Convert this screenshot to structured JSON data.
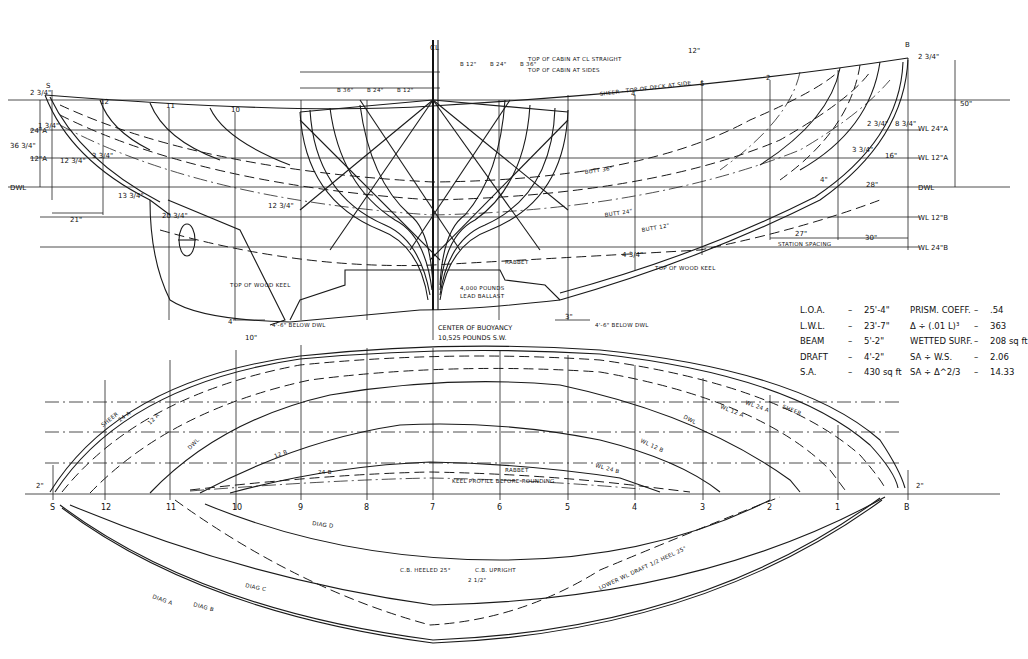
{
  "drawing": {
    "type": "yacht lines plan",
    "views": [
      "profile",
      "body-plan",
      "half-breadth"
    ],
    "colors": {
      "ink": "#1a1a1a",
      "paper": "#ffffff"
    }
  },
  "profile": {
    "stations": [
      "S",
      "12",
      "11",
      "10",
      "9",
      "8",
      "7",
      "6",
      "5",
      "4",
      "3",
      "2",
      "1",
      "B"
    ],
    "waterlines_right": [
      "WL 24\"A",
      "WL 12\"A",
      "DWL",
      "WL 12\"B",
      "WL 24\"B"
    ],
    "waterlines_left": [
      "24\"A",
      "12\"A",
      "DWL"
    ],
    "dims": {
      "stern_height": "36 3/4\"",
      "bow_height": "50\"",
      "stern_overhang": "21\"",
      "station_spacing_value": "27\"",
      "station_spacing_label": "STATION SPACING",
      "bow_overhang": "30\"",
      "transom_top": "2 3/4\"",
      "bow_top": "2 3/4\"",
      "rudder_heel": "10\"",
      "rudder_drop": "4\"",
      "keel_drop": "3\""
    },
    "offsets_left": [
      "2 3/4\"",
      "1 3/4\"",
      "2 3/4\"",
      "12 3/4\"",
      "3 3/4\"",
      "13 3/4\"",
      "3 3/4\"",
      "20 3/4\"",
      "12 3/4\"",
      "2 3/4\""
    ],
    "offsets_right": [
      "2 3/4\"",
      "8 3/4\"",
      "3 3/4\"",
      "16\"",
      "4\"",
      "28\""
    ],
    "buttocks": [
      "BUTT 36\"",
      "BUTT 24\"",
      "BUTT 12\""
    ],
    "notes": {
      "sheer": "SHEER - TOP OF DECK AT SIDE",
      "top_wood_keel_aft": "TOP OF WOOD KEEL",
      "top_wood_keel_fwd": "TOP OF WOOD KEEL",
      "rabbet": "RABBET",
      "ballast_weight": "4,000 POUNDS",
      "ballast_label": "LEAD BALLAST",
      "below_dwl_aft": "4'-6\" BELOW DWL",
      "below_dwl_fwd": "4'-6\" BELOW DWL",
      "keel_ht": "4 3/4\"",
      "top_of_cabin_straight": "TOP OF CABIN AT CL STRAIGHT",
      "top_of_cabin_side": "TOP OF CABIN AT SIDES",
      "cabin_dim": "12\""
    },
    "center_of_buoyancy": {
      "title": "CENTER OF BUOYANCY",
      "weight": "10,525",
      "units": "POUNDS S.W."
    }
  },
  "body_plan": {
    "centerline": "CL",
    "top_labels_left": [
      "B 36\"",
      "B 24\"",
      "B 12\""
    ],
    "top_labels_right": [
      "B 12\"",
      "B 24\"",
      "B 36\""
    ],
    "sections_left": [
      "S",
      "12",
      "11",
      "10",
      "9"
    ],
    "sections_right": [
      "6",
      "5",
      "4",
      "3",
      "2",
      "1"
    ]
  },
  "half_breadth": {
    "stations": [
      "S",
      "12",
      "11",
      "10",
      "9",
      "8",
      "7",
      "6",
      "5",
      "4",
      "3",
      "2",
      "1",
      "B"
    ],
    "lines": [
      "SHEER",
      "24 A",
      "12 A",
      "DWL",
      "12 B",
      "24 B",
      "RABBET",
      "KEEL PROFILE BEFORE ROUNDING"
    ],
    "lines_right": [
      "WL 24 A",
      "WL 12 A",
      "DWL",
      "WL 12 B",
      "WL 24 B",
      "SHEER"
    ],
    "diagonals": [
      "DIAG A",
      "DIAG B",
      "DIAG C",
      "DIAG D"
    ],
    "diag_labels_right": [
      "A",
      "B",
      "C",
      "D"
    ],
    "load_line_note": "LOWER WL DRAFT 1/2 HEEL 25°",
    "cb_heeled": "C.B. HEELED 25°",
    "cb_upright": "C.B. UPRIGHT",
    "cb_shift": "2 1/2\"",
    "end_dims": [
      "2\"",
      "2\""
    ]
  },
  "specs": {
    "left": [
      {
        "key": "L.O.A.",
        "value": "25'-4\""
      },
      {
        "key": "L.W.L.",
        "value": "23'-7\""
      },
      {
        "key": "BEAM",
        "value": "5'-2\""
      },
      {
        "key": "DRAFT",
        "value": "4'-2\""
      },
      {
        "key": "S.A.",
        "value": "430 sq ft"
      }
    ],
    "right": [
      {
        "key": "PRISM. COEFF.",
        "value": ".54"
      },
      {
        "key": "Δ ÷ (.01 L)³",
        "value": "363"
      },
      {
        "key": "WETTED SURF.",
        "value": "208 sq ft"
      },
      {
        "key": "SA ÷ W.S.",
        "value": "2.06"
      },
      {
        "key": "SA ÷ Δ^2/3",
        "value": "14.33"
      }
    ]
  }
}
